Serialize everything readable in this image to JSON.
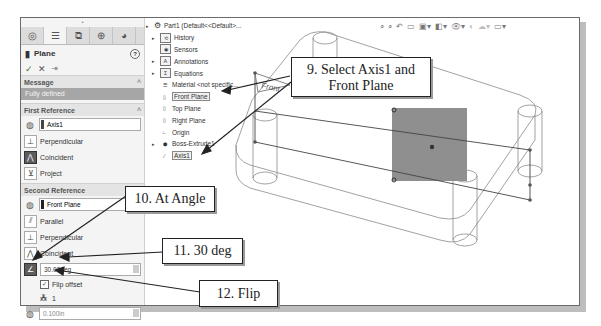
{
  "property_manager": {
    "tabs": [
      {
        "icon": "feature-manager-icon"
      },
      {
        "icon": "property-manager-icon"
      },
      {
        "icon": "configuration-manager-icon"
      },
      {
        "icon": "dimxpert-icon"
      },
      {
        "icon": "display-manager-icon"
      }
    ],
    "title": "Plane",
    "help": "?",
    "actions": {
      "ok": "✓",
      "cancel": "✕",
      "pin": "⇥"
    },
    "message": {
      "header": "Message",
      "text": "Fully defined"
    },
    "first_reference": {
      "header": "First Reference",
      "selection": "Axis1",
      "options": [
        "Perpendicular",
        "Coincident",
        "Project"
      ]
    },
    "second_reference": {
      "header": "Second Reference",
      "selection": "Front Plane",
      "options": [
        "Parallel",
        "Perpendicular",
        "Coincident"
      ],
      "angle_value": "30.00deg",
      "flip_offset_label": "Flip offset",
      "flip_offset_checked": true,
      "instances": "1",
      "third_field": "0.100in"
    }
  },
  "feature_tree": {
    "root": "Part1 (Default<<Default>...",
    "items": [
      {
        "label": "History",
        "expandable": true
      },
      {
        "label": "Sensors",
        "expandable": false
      },
      {
        "label": "Annotations",
        "expandable": true
      },
      {
        "label": "Equations",
        "expandable": true
      },
      {
        "label": "Material <not specific...",
        "expandable": false
      },
      {
        "label": "Front Plane",
        "expandable": false,
        "highlighted": true
      },
      {
        "label": "Top Plane",
        "expandable": false
      },
      {
        "label": "Right Plane",
        "expandable": false
      },
      {
        "label": "Origin",
        "expandable": false
      },
      {
        "label": "Boss-Extrude1",
        "expandable": true
      },
      {
        "label": "Axis1",
        "expandable": false,
        "highlighted": true
      }
    ]
  },
  "toolbar": {
    "icons": [
      "zoom-to-fit",
      "zoom-area",
      "previous-view",
      "section-view",
      "view-orientation",
      "display-style",
      "hide-show",
      "edit-appearance",
      "apply-scene",
      "view-settings"
    ]
  },
  "viewport": {
    "plane_label": "Front"
  },
  "callouts": {
    "step9": "9. Select Axis1 and Front Plane",
    "step9_line1": "9. Select Axis1 and",
    "step9_line2": "Front Plane",
    "step10": "10. At Angle",
    "step11": "11. 30 deg",
    "step12": "12. Flip"
  },
  "colors": {
    "selected_plane": "#8f8f8f",
    "message_bar": "#a6a6a6",
    "ok_check": "#3a7d2c"
  }
}
